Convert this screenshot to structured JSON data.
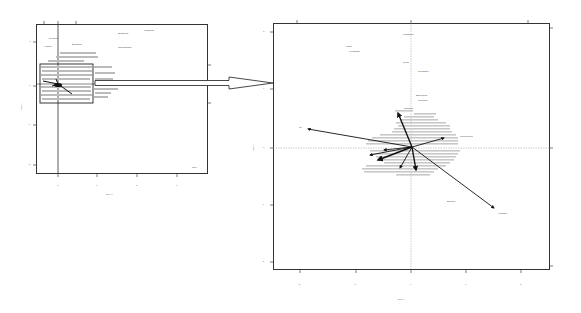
{
  "figure": {
    "overview": {
      "frame": {
        "x": 36,
        "y": 24,
        "w": 172,
        "h": 150
      },
      "corner_label": "pt(0)",
      "xlabel": "Dim 1",
      "ylabel": "Dim 2",
      "x_ticks_px": [
        58,
        97,
        137,
        177
      ],
      "x_tick_labels": [
        "0",
        "1",
        "2",
        "3"
      ],
      "y_ticks_px": [
        42,
        86,
        125,
        165
      ],
      "y_tick_labels": [
        "1",
        "0",
        "-1",
        "-2"
      ],
      "selection_box": {
        "x": 40,
        "y": 64,
        "w": 53,
        "h": 39
      },
      "top_labels": [
        {
          "text": "Aberdeen",
          "x": 48,
          "y": 38
        },
        {
          "text": "Atlanta",
          "x": 44,
          "y": 46
        },
        {
          "text": "Bergamo",
          "x": 72,
          "y": 44
        },
        {
          "text": "Budapest",
          "x": 118,
          "y": 33
        },
        {
          "text": "Hamburg",
          "x": 144,
          "y": 30
        },
        {
          "text": "Copenhagen",
          "x": 118,
          "y": 47
        }
      ]
    },
    "zoom_arrow": {
      "from_x": 95,
      "to_x": 273,
      "y": 83
    },
    "detail": {
      "frame": {
        "x": 273,
        "y": 23,
        "w": 277,
        "h": 247
      },
      "xlabel": "Dim 1",
      "ylabel": "Dim 2",
      "x_ticks_px": [
        300,
        356,
        411,
        466,
        521
      ],
      "x_tick_labels": [
        "-2",
        "-1",
        "0",
        "1",
        "2"
      ],
      "y_ticks_px": [
        32,
        89,
        148,
        205,
        262
      ],
      "y_tick_labels": [
        "2",
        "1",
        "0",
        "-1",
        "-2"
      ],
      "origin": {
        "x": 412,
        "y": 147
      },
      "arrows": [
        {
          "name": "var-upper-left",
          "x": 308,
          "y": 129,
          "label": "Ta"
        },
        {
          "name": "var-lower-right",
          "x": 494,
          "y": 208,
          "label": "Humidity"
        },
        {
          "name": "var-right",
          "x": 444,
          "y": 138,
          "label": "Wind speed"
        },
        {
          "name": "var-up",
          "x": 398,
          "y": 113,
          "label": "Pressure"
        },
        {
          "name": "var-left-1",
          "x": 370,
          "y": 155,
          "label": "Rain"
        },
        {
          "name": "var-left-2",
          "x": 378,
          "y": 160,
          "label": "Cloud"
        },
        {
          "name": "var-down",
          "x": 416,
          "y": 170,
          "label": "Sun"
        },
        {
          "name": "var-down-left",
          "x": 400,
          "y": 168,
          "label": "Temp"
        }
      ],
      "point_labels": [
        {
          "text": "Kalgoorlie",
          "x": 403,
          "y": 34
        },
        {
          "text": "Albany",
          "x": 345,
          "y": 46
        },
        {
          "text": "Wyndham",
          "x": 349,
          "y": 51
        },
        {
          "text": "Perth",
          "x": 403,
          "y": 62
        },
        {
          "text": "Geraldton",
          "x": 418,
          "y": 71
        },
        {
          "text": "Esperance",
          "x": 416,
          "y": 95
        },
        {
          "text": "Merredin",
          "x": 418,
          "y": 100
        },
        {
          "text": "Northam",
          "x": 404,
          "y": 108
        },
        {
          "text": "Bunbury",
          "x": 447,
          "y": 201
        },
        {
          "text": "Port Hedland",
          "x": 460,
          "y": 137
        }
      ],
      "dense_cluster": {
        "x": 372,
        "y": 108,
        "w": 88,
        "h": 65
      }
    },
    "colors": {
      "frame": "#333333",
      "arrow": "#222222",
      "text": "#444444",
      "zero_line": "#999999"
    }
  }
}
